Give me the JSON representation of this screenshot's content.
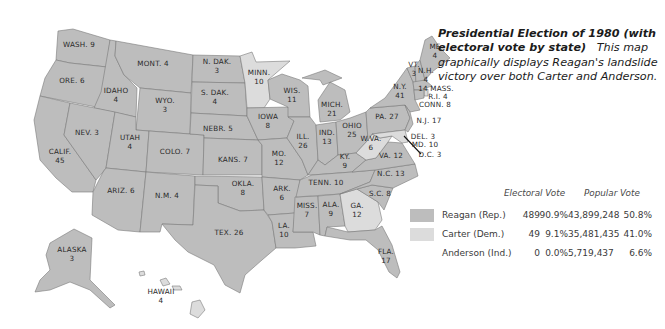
{
  "colors": {
    "reagan": "#bdbdbd",
    "carter": "#dcdcdc",
    "border": "#7a7a7a",
    "text": "#2a2a2a"
  },
  "caption": {
    "title": "Presidential Election of 1980 (with electoral vote by state)",
    "description": "This map graphically displays Reagan's landslide victory over both Carter and Anderson."
  },
  "legend": {
    "headers": {
      "electoral": "Electoral Vote",
      "popular": "Popular Vote"
    },
    "rows": [
      {
        "name": "Reagan (Rep.)",
        "swatch": "reagan",
        "electoral_votes": "489",
        "electoral_pct": "90.9%",
        "popular_votes": "43,899,248",
        "popular_pct": "50.8%"
      },
      {
        "name": "Carter (Dem.)",
        "swatch": "carter",
        "electoral_votes": "49",
        "electoral_pct": "9.1%",
        "popular_votes": "35,481,435",
        "popular_pct": "41.0%"
      },
      {
        "name": "Anderson (Ind.)",
        "swatch": "none",
        "electoral_votes": "0",
        "electoral_pct": "0.0%",
        "popular_votes": "5,719,437",
        "popular_pct": "6.6%"
      }
    ]
  },
  "states": [
    {
      "abbr": "WASH.",
      "ev": "9",
      "winner": "reagan",
      "label": "WASH. 9",
      "x": 79,
      "y": 44
    },
    {
      "abbr": "ORE.",
      "ev": "6",
      "winner": "reagan",
      "label": "ORE. 6",
      "x": 72,
      "y": 80
    },
    {
      "abbr": "CALIF.",
      "ev": "45",
      "winner": "reagan",
      "label": "CALIF.\n45",
      "x": 60,
      "y": 156
    },
    {
      "abbr": "IDAHO",
      "ev": "4",
      "winner": "reagan",
      "label": "IDAHO\n4",
      "x": 116,
      "y": 95
    },
    {
      "abbr": "NEV.",
      "ev": "3",
      "winner": "reagan",
      "label": "NEV. 3",
      "x": 87,
      "y": 132
    },
    {
      "abbr": "MONT.",
      "ev": "4",
      "winner": "reagan",
      "label": "MONT. 4",
      "x": 153,
      "y": 63
    },
    {
      "abbr": "WYO.",
      "ev": "3",
      "winner": "reagan",
      "label": "WYO.\n3",
      "x": 165,
      "y": 105
    },
    {
      "abbr": "UTAH",
      "ev": "4",
      "winner": "reagan",
      "label": "UTAH\n4",
      "x": 130,
      "y": 142
    },
    {
      "abbr": "COLO.",
      "ev": "7",
      "winner": "reagan",
      "label": "COLO. 7",
      "x": 175,
      "y": 151
    },
    {
      "abbr": "ARIZ.",
      "ev": "6",
      "winner": "reagan",
      "label": "ARIZ. 6",
      "x": 121,
      "y": 190
    },
    {
      "abbr": "N.M.",
      "ev": "4",
      "winner": "reagan",
      "label": "N.M. 4",
      "x": 167,
      "y": 195
    },
    {
      "abbr": "N. DAK.",
      "ev": "3",
      "winner": "reagan",
      "label": "N. DAK.\n3",
      "x": 217,
      "y": 66
    },
    {
      "abbr": "S. DAK.",
      "ev": "4",
      "winner": "reagan",
      "label": "S. DAK.\n4",
      "x": 215,
      "y": 97
    },
    {
      "abbr": "NEBR.",
      "ev": "5",
      "winner": "reagan",
      "label": "NEBR. 5",
      "x": 218,
      "y": 128
    },
    {
      "abbr": "KANS.",
      "ev": "7",
      "winner": "reagan",
      "label": "KANS. 7",
      "x": 233,
      "y": 159
    },
    {
      "abbr": "OKLA.",
      "ev": "8",
      "winner": "reagan",
      "label": "OKLA.\n8",
      "x": 243,
      "y": 188
    },
    {
      "abbr": "TEX.",
      "ev": "26",
      "winner": "reagan",
      "label": "TEX. 26",
      "x": 229,
      "y": 232
    },
    {
      "abbr": "MINN.",
      "ev": "10",
      "winner": "carter",
      "label": "MINN.\n10",
      "x": 259,
      "y": 77
    },
    {
      "abbr": "IOWA",
      "ev": "8",
      "winner": "reagan",
      "label": "IOWA\n8",
      "x": 268,
      "y": 121
    },
    {
      "abbr": "MO.",
      "ev": "12",
      "winner": "reagan",
      "label": "MO.\n12",
      "x": 279,
      "y": 158
    },
    {
      "abbr": "ARK.",
      "ev": "6",
      "winner": "reagan",
      "label": "ARK.\n6",
      "x": 282,
      "y": 193
    },
    {
      "abbr": "LA.",
      "ev": "10",
      "winner": "reagan",
      "label": "LA.\n10",
      "x": 284,
      "y": 230
    },
    {
      "abbr": "WIS.",
      "ev": "11",
      "winner": "reagan",
      "label": "WIS.\n11",
      "x": 292,
      "y": 95
    },
    {
      "abbr": "ILL.",
      "ev": "26",
      "winner": "reagan",
      "label": "ILL.\n26",
      "x": 303,
      "y": 141
    },
    {
      "abbr": "MISS.",
      "ev": "7",
      "winner": "reagan",
      "label": "MISS.\n7",
      "x": 307,
      "y": 210
    },
    {
      "abbr": "MICH.",
      "ev": "21",
      "winner": "reagan",
      "label": "MICH.\n21",
      "x": 332,
      "y": 109
    },
    {
      "abbr": "IND.",
      "ev": "13",
      "winner": "reagan",
      "label": "IND.\n13",
      "x": 327,
      "y": 137
    },
    {
      "abbr": "OHIO",
      "ev": "25",
      "winner": "reagan",
      "label": "OHIO\n25",
      "x": 352,
      "y": 130
    },
    {
      "abbr": "KY.",
      "ev": "9",
      "winner": "reagan",
      "label": "KY.\n9",
      "x": 345,
      "y": 161
    },
    {
      "abbr": "TENN.",
      "ev": "10",
      "winner": "reagan",
      "label": "TENN. 10",
      "x": 326,
      "y": 182
    },
    {
      "abbr": "ALA.",
      "ev": "9",
      "winner": "reagan",
      "label": "ALA.\n9",
      "x": 331,
      "y": 209
    },
    {
      "abbr": "GA.",
      "ev": "12",
      "winner": "carter",
      "label": "GA.\n12",
      "x": 357,
      "y": 210
    },
    {
      "abbr": "FLA.",
      "ev": "17",
      "winner": "reagan",
      "label": "FLA.\n17",
      "x": 386,
      "y": 256
    },
    {
      "abbr": "S.C.",
      "ev": "8",
      "winner": "reagan",
      "label": "S.C. 8",
      "x": 380,
      "y": 193
    },
    {
      "abbr": "N.C.",
      "ev": "13",
      "winner": "reagan",
      "label": "N.C. 13",
      "x": 391,
      "y": 173
    },
    {
      "abbr": "VA.",
      "ev": "12",
      "winner": "reagan",
      "label": "VA. 12",
      "x": 391,
      "y": 155
    },
    {
      "abbr": "W.VA.",
      "ev": "6",
      "winner": "carter",
      "label": "W.VA.\n6",
      "x": 371,
      "y": 143
    },
    {
      "abbr": "PA.",
      "ev": "27",
      "winner": "reagan",
      "label": "PA. 27",
      "x": 387,
      "y": 116
    },
    {
      "abbr": "N.Y.",
      "ev": "41",
      "winner": "reagan",
      "label": "N.Y.\n41",
      "x": 400,
      "y": 91
    },
    {
      "abbr": "N.J.",
      "ev": "17",
      "winner": "reagan",
      "label": "N.J. 17",
      "x": 429,
      "y": 120
    },
    {
      "abbr": "DEL.",
      "ev": "3",
      "winner": "reagan",
      "label": "DEL. 3",
      "x": 423,
      "y": 136
    },
    {
      "abbr": "MD.",
      "ev": "10",
      "winner": "carter",
      "label": "MD. 10",
      "x": 425,
      "y": 144
    },
    {
      "abbr": "D.C.",
      "ev": "3",
      "winner": "carter",
      "label": "D.C. 3",
      "x": 430,
      "y": 154
    },
    {
      "abbr": "VT.",
      "ev": "3",
      "winner": "reagan",
      "label": "VT.\n3",
      "x": 414,
      "y": 69
    },
    {
      "abbr": "N.H.",
      "ev": "4",
      "winner": "reagan",
      "label": "N.H.\n4",
      "x": 426,
      "y": 75
    },
    {
      "abbr": "ME",
      "ev": "4",
      "winner": "reagan",
      "label": "ME\n4",
      "x": 435,
      "y": 51
    },
    {
      "abbr": "MASS.",
      "ev": "14",
      "winner": "reagan",
      "label": "14 MASS.",
      "x": 436,
      "y": 88
    },
    {
      "abbr": "R.I.",
      "ev": "4",
      "winner": "carter",
      "label": "R.I. 4",
      "x": 438,
      "y": 96
    },
    {
      "abbr": "CONN.",
      "ev": "8",
      "winner": "reagan",
      "label": "CONN. 8",
      "x": 435,
      "y": 104
    },
    {
      "abbr": "ALASKA",
      "ev": "3",
      "winner": "reagan",
      "label": "ALASKA\n3",
      "x": 72,
      "y": 254
    },
    {
      "abbr": "HAWAII",
      "ev": "4",
      "winner": "carter",
      "label": "HAWAII\n4",
      "x": 161,
      "y": 296
    }
  ]
}
